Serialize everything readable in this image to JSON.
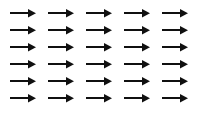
{
  "figure": {
    "canvas_width": 200,
    "canvas_height": 122,
    "background_color": "#ffffff",
    "rows": 6,
    "columns": 5,
    "total_arrows": 30,
    "column_x_positions": [
      10,
      48,
      86,
      124,
      162
    ],
    "row_y_positions": [
      13,
      30,
      47,
      64,
      81,
      98
    ],
    "arrow": {
      "direction": "right",
      "label": "right-arrow",
      "color": "#101010",
      "shaft_length": 18,
      "shaft_thickness": 1.6,
      "head_length": 8,
      "head_height": 8.5,
      "total_length": 26
    }
  }
}
